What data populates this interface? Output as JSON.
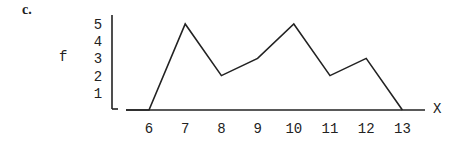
{
  "part_label": "c.",
  "chart_data": {
    "type": "line",
    "title": "",
    "xlabel": "X",
    "ylabel": "f",
    "x": [
      6,
      7,
      8,
      9,
      10,
      11,
      12,
      13
    ],
    "values": [
      0,
      5,
      2,
      3,
      5,
      2,
      3,
      0
    ],
    "x_ticks": [
      "6",
      "7",
      "8",
      "9",
      "10",
      "11",
      "12",
      "13"
    ],
    "y_ticks": [
      "1",
      "2",
      "3",
      "4",
      "5"
    ],
    "ylim": [
      0,
      5
    ],
    "xlim": [
      5.4,
      13.6
    ],
    "grid": false,
    "legend": null,
    "line_color": "#222222"
  }
}
